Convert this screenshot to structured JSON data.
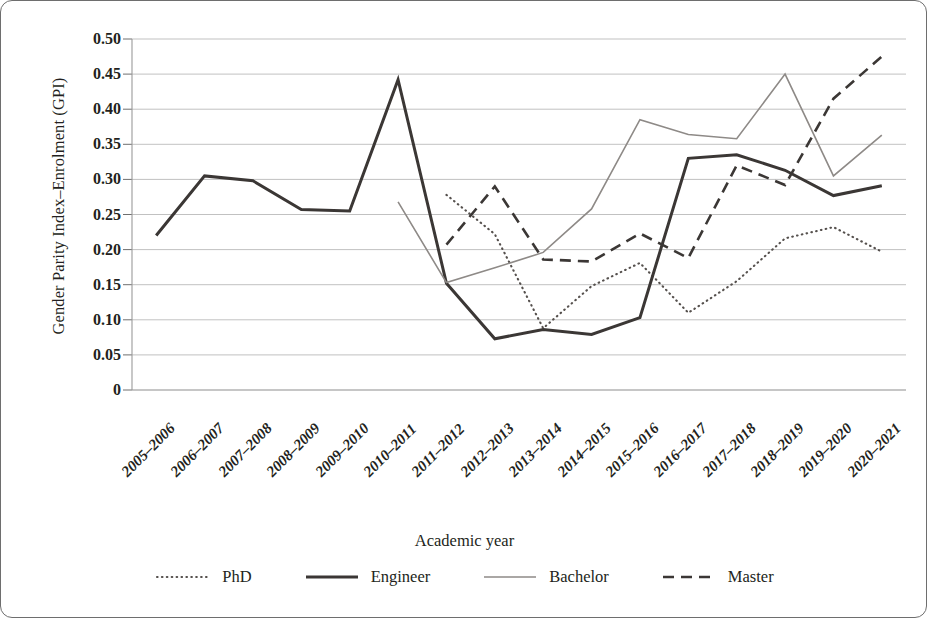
{
  "figure": {
    "x_axis_title": "Academic year",
    "y_axis_title": "Gender Parity Index–Enrolment (GPI)"
  },
  "axis": {
    "y_ticks": [
      "0.50",
      "0.45",
      "0.40",
      "0.35",
      "0.30",
      "0.25",
      "0.20",
      "0.15",
      "0.10",
      "0.05",
      "0"
    ]
  },
  "legend": {
    "items": [
      {
        "label": "PhD",
        "style": "dotted",
        "color": "#55504d"
      },
      {
        "label": "Engineer",
        "style": "solid-thick",
        "color": "#3b3735"
      },
      {
        "label": "Bachelor",
        "style": "solid-thin",
        "color": "#8e8a87"
      },
      {
        "label": "Master",
        "style": "dashed",
        "color": "#3b3735"
      }
    ]
  },
  "chart_data": {
    "type": "line",
    "title": "",
    "xlabel": "Academic year",
    "ylabel": "Gender Parity Index–Enrolment (GPI)",
    "ylim": [
      0,
      0.5
    ],
    "ytick_step": 0.05,
    "grid": true,
    "legend_position": "bottom",
    "categories": [
      "2005–2006",
      "2006–2007",
      "2007–2008",
      "2008–2009",
      "2009–2010",
      "2010–2011",
      "2011–2012",
      "2012–2013",
      "2013–2014",
      "2014–2015",
      "2015–2016",
      "2016–2017",
      "2017–2018",
      "2018–2019",
      "2019–2020",
      "2020–2021"
    ],
    "series": [
      {
        "name": "PhD",
        "style": "dotted",
        "color": "#55504d",
        "values": [
          null,
          null,
          null,
          null,
          null,
          null,
          0.278,
          0.222,
          0.088,
          0.148,
          0.181,
          0.11,
          0.155,
          0.216,
          0.232,
          0.197
        ]
      },
      {
        "name": "Engineer",
        "style": "solid-thick",
        "color": "#3b3735",
        "values": [
          0.22,
          0.305,
          0.298,
          0.257,
          0.255,
          0.442,
          0.152,
          0.073,
          0.086,
          0.079,
          0.103,
          0.33,
          0.335,
          0.313,
          0.277,
          0.291
        ]
      },
      {
        "name": "Bachelor",
        "style": "solid-thin",
        "color": "#8e8a87",
        "values": [
          null,
          null,
          null,
          null,
          null,
          0.268,
          0.153,
          0.174,
          0.196,
          0.258,
          0.385,
          0.364,
          0.358,
          0.45,
          0.305,
          0.363
        ]
      },
      {
        "name": "Master",
        "style": "dashed",
        "color": "#3b3735",
        "values": [
          null,
          null,
          null,
          null,
          null,
          null,
          0.207,
          0.29,
          0.186,
          0.183,
          0.223,
          0.188,
          0.32,
          0.292,
          0.415,
          0.475
        ]
      }
    ]
  }
}
